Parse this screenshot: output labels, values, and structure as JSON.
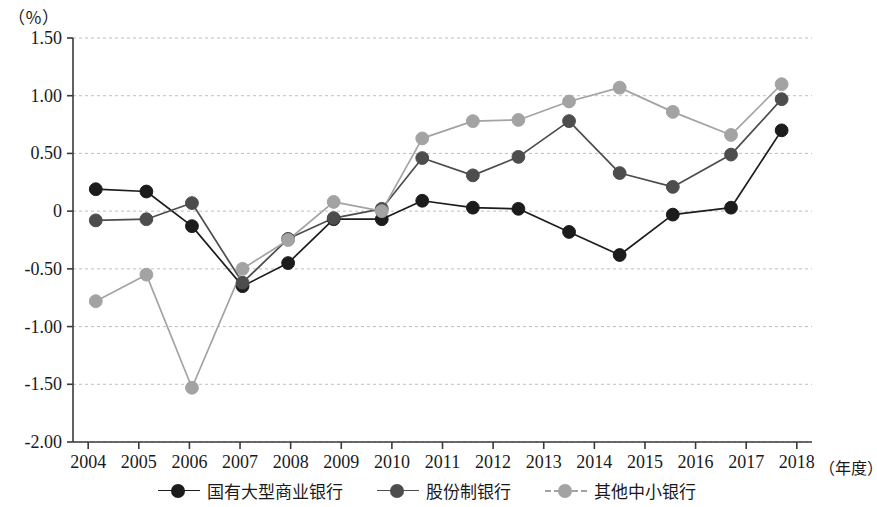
{
  "chart_data": {
    "type": "line",
    "title": "",
    "subtitle": "",
    "xlabel": "（年度）",
    "ylabel": "（％）",
    "ylim": [
      -2.0,
      1.5
    ],
    "xlim": [
      2003.7,
      2018.3
    ],
    "grid": true,
    "legend_position": "bottom",
    "y_ticks": [
      1.5,
      1.0,
      0.5,
      0,
      -0.5,
      -1.0,
      -1.5,
      -2.0
    ],
    "y_tick_labels": [
      "1.50",
      "1.00",
      "0.50",
      "0",
      "-0.50",
      "-1.00",
      "-1.50",
      "-2.00"
    ],
    "x_ticks": [
      2004,
      2005,
      2006,
      2007,
      2008,
      2009,
      2010,
      2011,
      2012,
      2013,
      2014,
      2015,
      2016,
      2017,
      2018
    ],
    "x_tick_labels": [
      "2004",
      "2005",
      "2006",
      "2007",
      "2008",
      "2009",
      "2010",
      "2011",
      "2012",
      "2013",
      "2014",
      "2015",
      "2016",
      "2017",
      "2018"
    ],
    "series": [
      {
        "name": "国有大型商业银行",
        "color": "#1c1c1c",
        "marker": "circle",
        "x": [
          2004.15,
          2005.15,
          2006.05,
          2007.05,
          2007.95,
          2008.85,
          2009.8,
          2010.6,
          2011.6,
          2012.5,
          2013.5,
          2014.5,
          2015.55,
          2016.7,
          2017.7
        ],
        "values": [
          0.19,
          0.17,
          -0.13,
          -0.65,
          -0.45,
          -0.07,
          -0.07,
          0.09,
          0.03,
          0.02,
          -0.18,
          -0.38,
          -0.03,
          0.03,
          0.7
        ]
      },
      {
        "name": "股份制银行",
        "color": "#4d4d4d",
        "marker": "circle",
        "x": [
          2004.15,
          2005.15,
          2006.05,
          2007.05,
          2007.95,
          2008.85,
          2009.8,
          2010.6,
          2011.6,
          2012.5,
          2013.5,
          2014.5,
          2015.55,
          2016.7,
          2017.7
        ],
        "values": [
          -0.08,
          -0.07,
          0.07,
          -0.62,
          -0.24,
          -0.06,
          0.02,
          0.46,
          0.31,
          0.47,
          0.78,
          0.33,
          0.21,
          0.49,
          0.97
        ]
      },
      {
        "name": "其他中小银行",
        "color": "#a3a3a3",
        "marker": "circle",
        "x": [
          2004.15,
          2005.15,
          2006.05,
          2007.05,
          2007.95,
          2008.85,
          2009.8,
          2010.6,
          2011.6,
          2012.5,
          2013.5,
          2014.5,
          2015.55,
          2016.7,
          2017.7
        ],
        "values": [
          -0.78,
          -0.55,
          -1.53,
          -0.5,
          -0.25,
          0.08,
          0.0,
          0.63,
          0.78,
          0.79,
          0.95,
          1.07,
          0.86,
          0.66,
          1.1
        ]
      }
    ]
  },
  "legend": {
    "items": [
      {
        "label": "国有大型商业银行",
        "color": "#1c1c1c",
        "dashed": false
      },
      {
        "label": "股份制银行",
        "color": "#4d4d4d",
        "dashed": false
      },
      {
        "label": "其他中小银行",
        "color": "#a3a3a3",
        "dashed": true
      }
    ]
  },
  "axes": {
    "y_unit_label": "（％）",
    "x_unit_label": "（年度）"
  },
  "colors": {
    "axis": "#3a3a3a",
    "grid": "#c9b9b9",
    "background": "#ffffff"
  }
}
